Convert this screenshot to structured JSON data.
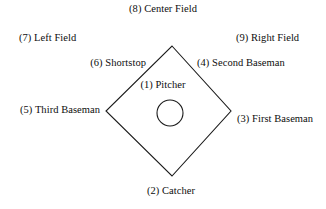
{
  "diagram": {
    "shape": {
      "infield_diamond": "diamond",
      "pitcher_mound": "circle",
      "line_color": "#1a1a1a",
      "fill_color": "#ffffff",
      "background_color": "#ffffff"
    },
    "geometry": {
      "diamond_top": {
        "x": 172,
        "y": 46
      },
      "diamond_right": {
        "x": 231,
        "y": 111
      },
      "diamond_bottom": {
        "x": 172,
        "y": 176
      },
      "diamond_left": {
        "x": 106,
        "y": 111
      },
      "mound_center": {
        "x": 170,
        "y": 113
      },
      "mound_radius": 13
    },
    "positions": [
      {
        "number": "(1)",
        "name": "Pitcher",
        "label": "(1) Pitcher",
        "x": 163,
        "y": 79,
        "anchor": "center"
      },
      {
        "number": "(2)",
        "name": "Catcher",
        "label": "(2) Catcher",
        "x": 171,
        "y": 185,
        "anchor": "center"
      },
      {
        "number": "(3)",
        "name": "First Baseman",
        "label": "(3) First Baseman",
        "x": 237,
        "y": 113,
        "anchor": "left"
      },
      {
        "number": "(4)",
        "name": "Second Baseman",
        "label": "(4) Second Baseman",
        "x": 197,
        "y": 57,
        "anchor": "left"
      },
      {
        "number": "(5)",
        "name": "Third Baseman",
        "label": "(5) Third Baseman",
        "x": 100,
        "y": 104,
        "anchor": "right"
      },
      {
        "number": "(6)",
        "name": "Shortstop",
        "label": "(6) Shortstop",
        "x": 146,
        "y": 57,
        "anchor": "right"
      },
      {
        "number": "(7)",
        "name": "Left Field",
        "label": "(7) Left Field",
        "x": 19,
        "y": 32,
        "anchor": "left"
      },
      {
        "number": "(8)",
        "name": "Center Field",
        "label": "(8) Center Field",
        "x": 163,
        "y": 3,
        "anchor": "center"
      },
      {
        "number": "(9)",
        "name": "Right Field",
        "label": "(9) Right Field",
        "x": 236,
        "y": 32,
        "anchor": "left"
      }
    ]
  }
}
